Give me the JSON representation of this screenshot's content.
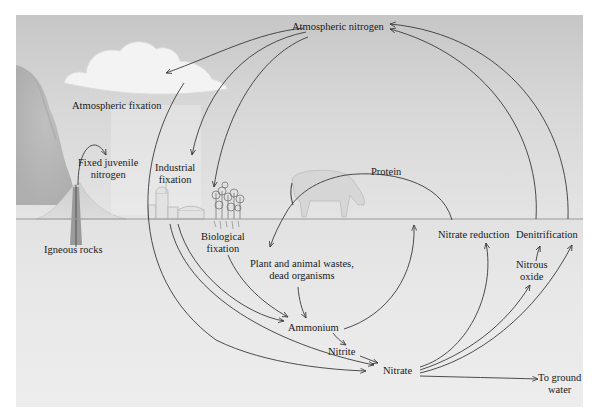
{
  "diagram": {
    "colors": {
      "sky": "#cfcfcf",
      "ground": "#e8e8e8",
      "arrow": "#3a3a3a",
      "text": "#1a1a1a",
      "background": "#ffffff"
    },
    "nodes": {
      "atmospheric_nitrogen": "Atmospheric nitrogen",
      "atmospheric_fixation": "Atmospheric fixation",
      "fixed_juvenile_nitrogen": [
        "Fixed juvenile",
        "nitrogen"
      ],
      "industrial_fixation": [
        "Industrial",
        "fixation"
      ],
      "biological_fixation": [
        "Biological",
        "fixation"
      ],
      "igneous_rocks": "Igneous rocks",
      "protein": "Protein",
      "plant_animal_wastes": [
        "Plant and animal wastes,",
        "dead organisms"
      ],
      "ammonium": "Ammonium",
      "nitrite": "Nitrite",
      "nitrate": "Nitrate",
      "nitrate_reduction": "Nitrate reduction",
      "denitrification": "Denitrification",
      "nitrous_oxide": [
        "Nitrous",
        "oxide"
      ],
      "to_ground_water": [
        "To ground",
        "water"
      ]
    },
    "illustrations": [
      "volcano-icon",
      "cloud-icon",
      "factory-icon",
      "plant-icon",
      "cow-icon"
    ],
    "edges": [
      {
        "from": "Atmospheric nitrogen",
        "to": "Atmospheric fixation (cloud)"
      },
      {
        "from": "Atmospheric nitrogen",
        "to": "Industrial fixation"
      },
      {
        "from": "Atmospheric nitrogen",
        "to": "Biological fixation (plants)"
      },
      {
        "from": "Atmospheric fixation",
        "to": "Nitrate"
      },
      {
        "from": "Igneous rocks",
        "to": "Fixed juvenile nitrogen"
      },
      {
        "from": "Industrial fixation",
        "to": "Ammonium"
      },
      {
        "from": "Industrial fixation",
        "to": "Nitrate"
      },
      {
        "from": "Biological fixation",
        "to": "Ammonium"
      },
      {
        "from": "Protein",
        "to": "Plant and animal wastes, dead organisms"
      },
      {
        "from": "Plant and animal wastes, dead organisms",
        "to": "Ammonium"
      },
      {
        "from": "Ammonium",
        "to": "Protein (plants)"
      },
      {
        "from": "Ammonium",
        "to": "Nitrite"
      },
      {
        "from": "Nitrite",
        "to": "Nitrate"
      },
      {
        "from": "Nitrate",
        "to": "Nitrate reduction"
      },
      {
        "from": "Nitrate",
        "to": "Nitrous oxide"
      },
      {
        "from": "Nitrous oxide",
        "to": "Denitrification"
      },
      {
        "from": "Nitrate",
        "to": "Denitrification"
      },
      {
        "from": "Nitrate",
        "to": "To ground water"
      },
      {
        "from": "Nitrate reduction",
        "to": "Atmospheric nitrogen"
      },
      {
        "from": "Denitrification",
        "to": "Atmospheric nitrogen"
      }
    ]
  }
}
